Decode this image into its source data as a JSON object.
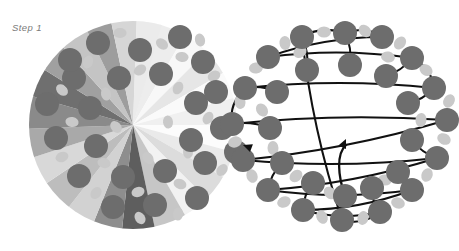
{
  "figure": {
    "caption": "Step 1",
    "type": "molecular-diagram",
    "panels": [
      {
        "id": "left",
        "name": "radial-wedge-cluster",
        "label": "Step 1"
      },
      {
        "id": "right",
        "name": "arrow-ring-network",
        "label": ""
      }
    ]
  },
  "colors": {
    "background": "#ffffff",
    "node_dark": "#6d6d6d",
    "node_light": "#c9c9c9",
    "arrow": "#111111",
    "caption_text": "#7a7a7a",
    "wedge_lightest": "#fbfbfb",
    "wedge_light": "#e9e9e9",
    "wedge_mid": "#cfcfcf",
    "wedge_dark": "#9a9a9a",
    "wedge_darkest": "#5e5e5e"
  },
  "left_panel": {
    "name": "radial-wedge-cluster",
    "center": {
      "x": 133,
      "y": 125
    },
    "wedge_count": 24,
    "node_radius": 12,
    "small_node_radius": 5,
    "wedges": [
      {
        "a0": -90,
        "a1": -75,
        "shade": "#f6f6f6"
      },
      {
        "a0": -75,
        "a1": -60,
        "shade": "#ededed"
      },
      {
        "a0": -60,
        "a1": -45,
        "shade": "#f8f8f8"
      },
      {
        "a0": -45,
        "a1": -30,
        "shade": "#e6e6e6"
      },
      {
        "a0": -30,
        "a1": -15,
        "shade": "#fafafa"
      },
      {
        "a0": -15,
        "a1": 0,
        "shade": "#f0f0f0"
      },
      {
        "a0": 0,
        "a1": 15,
        "shade": "#fcfcfc"
      },
      {
        "a0": 15,
        "a1": 30,
        "shade": "#eaeaea"
      },
      {
        "a0": 30,
        "a1": 45,
        "shade": "#dcdcdc"
      },
      {
        "a0": 45,
        "a1": 60,
        "shade": "#f2f2f2"
      },
      {
        "a0": 60,
        "a1": 78,
        "shade": "#c6c6c6"
      },
      {
        "a0": 78,
        "a1": 96,
        "shade": "#5e5e5e"
      },
      {
        "a0": 96,
        "a1": 112,
        "shade": "#8e8e8e"
      },
      {
        "a0": 112,
        "a1": 128,
        "shade": "#d2d2d2"
      },
      {
        "a0": 128,
        "a1": 146,
        "shade": "#bdbdbd"
      },
      {
        "a0": 146,
        "a1": 162,
        "shade": "#d8d8d8"
      },
      {
        "a0": 162,
        "a1": 178,
        "shade": "#a9a9a9"
      },
      {
        "a0": 178,
        "a1": 196,
        "shade": "#8a8a8a"
      },
      {
        "a0": 196,
        "a1": 212,
        "shade": "#6f6f6f"
      },
      {
        "a0": 212,
        "a1": 228,
        "shade": "#a0a0a0"
      },
      {
        "a0": 228,
        "a1": 244,
        "shade": "#c4c4c4"
      },
      {
        "a0": 244,
        "a1": 258,
        "shade": "#9d9d9d"
      },
      {
        "a0": 258,
        "a1": 272,
        "shade": "#d6d6d6"
      },
      {
        "a0": 272,
        "a1": 286,
        "shade": "#ebebeb"
      }
    ],
    "nodes": [
      {
        "x": 98,
        "y": 43
      },
      {
        "x": 140,
        "y": 50
      },
      {
        "x": 180,
        "y": 37
      },
      {
        "x": 74,
        "y": 78
      },
      {
        "x": 119,
        "y": 78
      },
      {
        "x": 161,
        "y": 74
      },
      {
        "x": 203,
        "y": 62
      },
      {
        "x": 47,
        "y": 104
      },
      {
        "x": 90,
        "y": 108
      },
      {
        "x": 196,
        "y": 103
      },
      {
        "x": 216,
        "y": 92
      },
      {
        "x": 56,
        "y": 138
      },
      {
        "x": 96,
        "y": 146
      },
      {
        "x": 191,
        "y": 140
      },
      {
        "x": 222,
        "y": 128
      },
      {
        "x": 79,
        "y": 176
      },
      {
        "x": 123,
        "y": 177
      },
      {
        "x": 165,
        "y": 171
      },
      {
        "x": 205,
        "y": 163
      },
      {
        "x": 113,
        "y": 207
      },
      {
        "x": 155,
        "y": 205
      },
      {
        "x": 197,
        "y": 198
      },
      {
        "x": 70,
        "y": 60
      },
      {
        "x": 236,
        "y": 152
      }
    ],
    "small_nodes": [
      {
        "x": 120,
        "y": 33
      },
      {
        "x": 162,
        "y": 44
      },
      {
        "x": 200,
        "y": 40
      },
      {
        "x": 88,
        "y": 62
      },
      {
        "x": 140,
        "y": 70
      },
      {
        "x": 182,
        "y": 57
      },
      {
        "x": 62,
        "y": 90
      },
      {
        "x": 106,
        "y": 94
      },
      {
        "x": 178,
        "y": 88
      },
      {
        "x": 214,
        "y": 76
      },
      {
        "x": 72,
        "y": 122
      },
      {
        "x": 116,
        "y": 127
      },
      {
        "x": 168,
        "y": 122
      },
      {
        "x": 208,
        "y": 118
      },
      {
        "x": 62,
        "y": 157
      },
      {
        "x": 104,
        "y": 163
      },
      {
        "x": 148,
        "y": 158
      },
      {
        "x": 188,
        "y": 152
      },
      {
        "x": 96,
        "y": 193
      },
      {
        "x": 138,
        "y": 192
      },
      {
        "x": 180,
        "y": 184
      },
      {
        "x": 140,
        "y": 218
      },
      {
        "x": 178,
        "y": 214
      },
      {
        "x": 222,
        "y": 170
      }
    ]
  },
  "right_panel": {
    "name": "arrow-ring-network",
    "node_radius": 12,
    "small_node_radius": 5.5,
    "ring_center": {
      "x": 342,
      "y": 128
    },
    "outer_nodes": [
      {
        "x": 302,
        "y": 37
      },
      {
        "x": 345,
        "y": 33
      },
      {
        "x": 382,
        "y": 37
      },
      {
        "x": 268,
        "y": 57
      },
      {
        "x": 412,
        "y": 58
      },
      {
        "x": 434,
        "y": 88
      },
      {
        "x": 245,
        "y": 88
      },
      {
        "x": 232,
        "y": 124
      },
      {
        "x": 447,
        "y": 120
      },
      {
        "x": 243,
        "y": 160
      },
      {
        "x": 437,
        "y": 158
      },
      {
        "x": 268,
        "y": 190
      },
      {
        "x": 412,
        "y": 190
      },
      {
        "x": 303,
        "y": 210
      },
      {
        "x": 380,
        "y": 212
      },
      {
        "x": 342,
        "y": 220
      }
    ],
    "inner_nodes": [
      {
        "x": 307,
        "y": 70
      },
      {
        "x": 350,
        "y": 65
      },
      {
        "x": 386,
        "y": 76
      },
      {
        "x": 277,
        "y": 92
      },
      {
        "x": 408,
        "y": 103
      },
      {
        "x": 270,
        "y": 128
      },
      {
        "x": 412,
        "y": 140
      },
      {
        "x": 282,
        "y": 163
      },
      {
        "x": 398,
        "y": 172
      },
      {
        "x": 313,
        "y": 183
      },
      {
        "x": 372,
        "y": 188
      },
      {
        "x": 345,
        "y": 196
      }
    ],
    "small_nodes": [
      {
        "x": 324,
        "y": 32
      },
      {
        "x": 365,
        "y": 31
      },
      {
        "x": 285,
        "y": 43
      },
      {
        "x": 400,
        "y": 43
      },
      {
        "x": 256,
        "y": 68
      },
      {
        "x": 426,
        "y": 70
      },
      {
        "x": 240,
        "y": 102
      },
      {
        "x": 449,
        "y": 101
      },
      {
        "x": 235,
        "y": 142
      },
      {
        "x": 444,
        "y": 139
      },
      {
        "x": 252,
        "y": 176
      },
      {
        "x": 427,
        "y": 175
      },
      {
        "x": 284,
        "y": 202
      },
      {
        "x": 398,
        "y": 203
      },
      {
        "x": 322,
        "y": 217
      },
      {
        "x": 363,
        "y": 218
      },
      {
        "x": 300,
        "y": 52
      },
      {
        "x": 388,
        "y": 57
      },
      {
        "x": 262,
        "y": 110
      },
      {
        "x": 421,
        "y": 120
      },
      {
        "x": 296,
        "y": 176
      },
      {
        "x": 385,
        "y": 180
      },
      {
        "x": 330,
        "y": 193
      },
      {
        "x": 273,
        "y": 148
      }
    ],
    "arrowheads": [
      {
        "x": 243,
        "y": 145,
        "angle": 200,
        "name": "arrowhead-left"
      },
      {
        "x": 346,
        "y": 139,
        "angle": -65,
        "name": "arrowhead-center"
      }
    ]
  }
}
